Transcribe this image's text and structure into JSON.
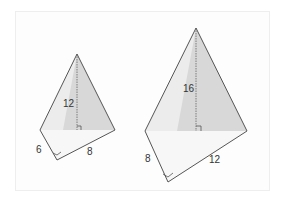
{
  "figure": {
    "colors": {
      "edge": "#555555",
      "shade_light": "#eeeeee",
      "shade_dark": "#d9d9d9",
      "base_fill": "#f7f7f7",
      "label": "#333333"
    }
  },
  "pyramids": [
    {
      "name": "small-pyramid",
      "height_label": "12",
      "base_edge_left_label": "6",
      "base_edge_right_label": "8"
    },
    {
      "name": "large-pyramid",
      "height_label": "16",
      "base_edge_left_label": "8",
      "base_edge_right_label": "12"
    }
  ]
}
